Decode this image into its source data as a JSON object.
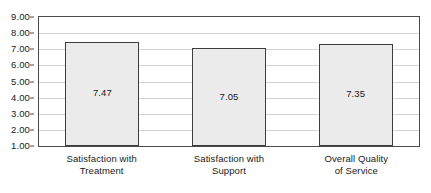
{
  "chart_data": {
    "type": "bar",
    "title": "",
    "subtitle": "",
    "xlabel": "",
    "ylabel": "",
    "ylim": [
      1.0,
      9.0
    ],
    "ytick_step": 1.0,
    "ytick_labels": [
      "9.00",
      "8.00",
      "7.00",
      "6.00",
      "5.00",
      "4.00",
      "3.00",
      "2.00",
      "1.00"
    ],
    "ytick_values": [
      9.0,
      8.0,
      7.0,
      6.0,
      5.0,
      4.0,
      3.0,
      2.0,
      1.0
    ],
    "grid": true,
    "grid_orientation": "horizontal",
    "legend": false,
    "legend_position": "none",
    "categories": [
      "Satisfaction with Treatment",
      "Satisfaction with Support",
      "Overall Quality of Service"
    ],
    "category_label_lines": [
      [
        "Satisfaction with",
        "Treatment"
      ],
      [
        "Satisfaction with",
        "Support"
      ],
      [
        "Overall Quality",
        "of Service"
      ]
    ],
    "values": [
      7.47,
      7.05,
      7.35
    ],
    "value_labels": [
      "7.47",
      "7.05",
      "7.35"
    ],
    "bars": [
      {
        "category": "Satisfaction with Treatment",
        "value": 7.47,
        "label": "7.47"
      },
      {
        "category": "Satisfaction with Support",
        "value": 7.05,
        "label": "7.05"
      },
      {
        "category": "Overall Quality of Service",
        "value": 7.35,
        "label": "7.35"
      }
    ],
    "colors": {
      "bar_fill": "#ebebeb",
      "bar_border": "#3d3d3d",
      "gridline": "#d4d4d4",
      "axis_border": "#4a4a4a",
      "text": "#1a1a1a",
      "background": "#ffffff"
    }
  }
}
